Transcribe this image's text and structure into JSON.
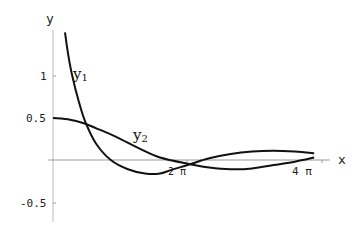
{
  "chart_data": {
    "type": "line",
    "title": "",
    "xlabel": "x",
    "ylabel": "y",
    "x_ticks": [
      "2 π",
      "4 π"
    ],
    "y_ticks": [
      "1",
      "0.5",
      "-0.5"
    ],
    "xlim": [
      0,
      12.566
    ],
    "ylim": [
      -0.75,
      1.5
    ],
    "grid": false,
    "legend": "none (inline curve labels)",
    "series": [
      {
        "name": "y1",
        "label": "y",
        "sub": "1",
        "x": [
          0.56,
          0.7,
          0.9,
          1.2,
          1.5,
          2.0,
          2.7,
          3.5,
          4.3,
          5.0,
          5.5,
          6.4,
          7.3,
          8.3,
          9.3,
          10.3,
          11.3,
          12.2
        ],
        "y": [
          1.52,
          1.27,
          1.0,
          0.7,
          0.46,
          0.2,
          0.0,
          -0.11,
          -0.16,
          -0.16,
          -0.12,
          -0.05,
          0.02,
          0.07,
          0.1,
          0.11,
          0.1,
          0.08
        ]
      },
      {
        "name": "y2",
        "label": "y",
        "sub": "2",
        "x": [
          0,
          0.8,
          1.4,
          2.0,
          3.0,
          4.0,
          5.0,
          6.4,
          7.3,
          8.3,
          9.3,
          10.3,
          11.3,
          12.2
        ],
        "y": [
          0.5,
          0.48,
          0.44,
          0.38,
          0.27,
          0.14,
          0.03,
          -0.05,
          -0.09,
          -0.11,
          -0.1,
          -0.06,
          -0.02,
          0.03
        ]
      }
    ]
  },
  "labels": {
    "x_axis": "x",
    "y_axis": "y",
    "tick_1": "1",
    "tick_05": "0.5",
    "tick_m05": "-0.5",
    "tick_2pi": "2 π",
    "tick_4pi": "4 π",
    "y1_main": "y",
    "y1_sub": "1",
    "y2_main": "y",
    "y2_sub": "2"
  }
}
